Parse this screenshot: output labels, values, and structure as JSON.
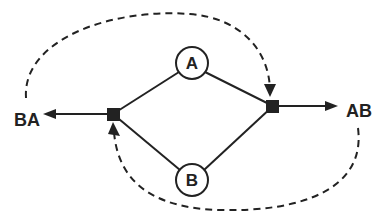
{
  "diagram": {
    "type": "flow-graph",
    "colors": {
      "stroke": "#222222",
      "background": "#ffffff"
    },
    "nodes": [
      {
        "id": "A",
        "label": "A",
        "shape": "circle",
        "cx": 192,
        "cy": 63,
        "r": 16
      },
      {
        "id": "B",
        "label": "B",
        "shape": "circle",
        "cx": 192,
        "cy": 180,
        "r": 16
      }
    ],
    "junctions": [
      {
        "id": "left-junction",
        "shape": "square",
        "cx": 113,
        "cy": 114,
        "size": 13
      },
      {
        "id": "right-junction",
        "shape": "square",
        "cx": 273,
        "cy": 106,
        "size": 13
      }
    ],
    "terminals": [
      {
        "id": "BA",
        "label": "BA",
        "x": 14,
        "y": 126
      },
      {
        "id": "AB",
        "label": "AB",
        "x": 346,
        "y": 117
      }
    ],
    "edges": [
      {
        "from": "left-junction",
        "to": "A",
        "style": "solid"
      },
      {
        "from": "A",
        "to": "right-junction",
        "style": "solid"
      },
      {
        "from": "left-junction",
        "to": "B",
        "style": "solid"
      },
      {
        "from": "B",
        "to": "right-junction",
        "style": "solid"
      },
      {
        "from": "left-junction",
        "to": "BA",
        "style": "solid-arrow"
      },
      {
        "from": "right-junction",
        "to": "AB",
        "style": "solid-arrow"
      },
      {
        "from": "BA",
        "to": "right-junction",
        "style": "dashed-arrow",
        "path": "over-top"
      },
      {
        "from": "AB",
        "to": "left-junction",
        "style": "dashed-arrow",
        "path": "under-bottom"
      }
    ]
  }
}
